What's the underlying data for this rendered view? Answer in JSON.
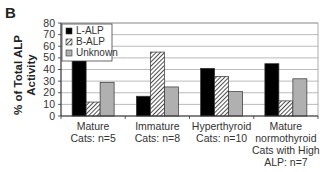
{
  "panel_label": "B",
  "chart_data": {
    "type": "bar",
    "title": "",
    "xlabel": "",
    "ylabel": "% of Total ALP Activity",
    "ylabel_lines": [
      "% of Total ALP",
      "Activity"
    ],
    "ylim": [
      0,
      80
    ],
    "yticks": [
      0,
      10,
      20,
      30,
      40,
      50,
      60,
      70,
      80
    ],
    "grid": true,
    "legend_position": "upper-left-inside",
    "categories": [
      [
        "Mature",
        "Cats: n=5"
      ],
      [
        "Immature",
        "Cats: n=8"
      ],
      [
        "Hyperthyroid",
        "Cats: n=10"
      ],
      [
        "Mature",
        "normothyroid",
        "Cats with High",
        "ALP: n=7"
      ]
    ],
    "category_names": [
      "Mature Cats: n=5",
      "Immature Cats: n=8",
      "Hyperthyroid Cats: n=10",
      "Mature normothyroid Cats with High ALP: n=7"
    ],
    "series": [
      {
        "name": "L-ALP",
        "fill": "#000000",
        "pattern": "solid",
        "values": [
          51,
          17,
          41,
          45
        ]
      },
      {
        "name": "B-ALP",
        "fill": "#ffffff",
        "pattern": "hatch",
        "values": [
          12,
          55,
          34,
          13
        ]
      },
      {
        "name": "Unknown",
        "fill": "#b0b0b0",
        "pattern": "solid",
        "values": [
          29,
          25,
          21,
          32
        ]
      }
    ]
  }
}
